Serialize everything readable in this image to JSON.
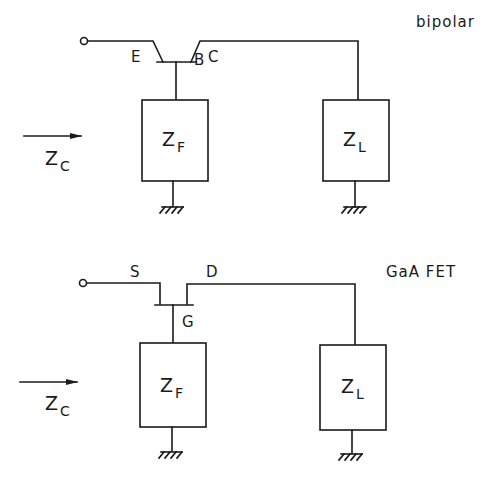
{
  "colors": {
    "ink": "#1a1a1a",
    "background": "#ffffff"
  },
  "bipolar": {
    "title": "bipolar",
    "pins": {
      "emitter": "E",
      "base": "B",
      "collector": "C"
    },
    "feedback_impedance": {
      "main": "Z",
      "sub": "F"
    },
    "load_impedance": {
      "main": "Z",
      "sub": "L"
    },
    "input_impedance": {
      "main": "Z",
      "sub": "C"
    }
  },
  "fet": {
    "title": "GaA FET",
    "pins": {
      "source": "S",
      "gate": "G",
      "drain": "D"
    },
    "feedback_impedance": {
      "main": "Z",
      "sub": "F"
    },
    "load_impedance": {
      "main": "Z",
      "sub": "L"
    },
    "input_impedance": {
      "main": "Z",
      "sub": "C"
    }
  }
}
